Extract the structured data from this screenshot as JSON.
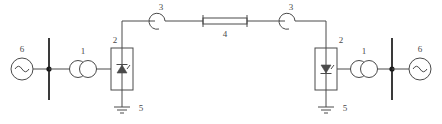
{
  "diagram": {
    "background_color": "#ffffff",
    "line_color": "#4a4a4a",
    "width": 442,
    "height": 124,
    "legend_scheme": "numeric reference callouts",
    "components": [
      {
        "ref": "6",
        "name": "ac-source-left",
        "symbol": "ac-voltage-source-icon",
        "description": "AC voltage source (circle with sine wave)",
        "label": "6"
      },
      {
        "ref": "1",
        "name": "converter-transformer-left",
        "symbol": "two-winding-transformer-icon",
        "description": "Two-winding converter transformer (two overlapping circles)",
        "label": "1"
      },
      {
        "ref": "2",
        "name": "converter-valve-left",
        "symbol": "thyristor-converter-icon",
        "description": "Thyristor converter valve block (rectangle with thyristor symbol)",
        "label": "2"
      },
      {
        "ref": "5",
        "name": "ground-left",
        "symbol": "earth-ground-icon",
        "description": "Earth ground connection",
        "label": "5"
      },
      {
        "ref": "3",
        "name": "dc-breaker-left",
        "symbol": "dc-circuit-breaker-icon",
        "description": "DC circuit breaker / smoothing element (arc hook symbol)",
        "label": "3"
      },
      {
        "ref": "4",
        "name": "dc-transmission-line",
        "symbol": "dc-line-icon",
        "description": "DC transmission line / cable (long rectangle with end bars)",
        "label": "4"
      },
      {
        "ref": "3",
        "name": "dc-breaker-right",
        "symbol": "dc-circuit-breaker-icon",
        "description": "DC circuit breaker / smoothing element (arc hook symbol)",
        "label": "3"
      },
      {
        "ref": "2",
        "name": "converter-valve-right",
        "symbol": "thyristor-converter-icon",
        "description": "Thyristor converter valve block (rectangle with thyristor symbol)",
        "label": "2"
      },
      {
        "ref": "5",
        "name": "ground-right",
        "symbol": "earth-ground-icon",
        "description": "Earth ground connection",
        "label": "5"
      },
      {
        "ref": "1",
        "name": "converter-transformer-right",
        "symbol": "two-winding-transformer-icon",
        "description": "Two-winding converter transformer (two overlapping circles)",
        "label": "1"
      },
      {
        "ref": "6",
        "name": "ac-source-right",
        "symbol": "ac-voltage-source-icon",
        "description": "AC voltage source (circle with sine wave)",
        "label": "6"
      }
    ],
    "labels": {
      "source_left": "6",
      "transformer_left": "1",
      "converter_left": "2",
      "ground_left": "5",
      "breaker_left": "3",
      "dc_line": "4",
      "breaker_right": "3",
      "converter_right": "2",
      "ground_right": "5",
      "transformer_right": "1",
      "source_right": "6"
    }
  }
}
